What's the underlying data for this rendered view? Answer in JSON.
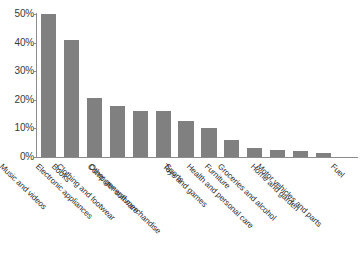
{
  "chart_data": {
    "type": "bar",
    "title": "",
    "subtitle": "",
    "xlabel": "",
    "ylabel": "",
    "ylim": [
      0,
      50
    ],
    "grid": false,
    "legend": null,
    "orientation": "vertical",
    "bar_color": "#808080",
    "axis_color": "#8c8c8c",
    "text_color": "#2e2e2e",
    "categories": [
      "Music and videos",
      "Books",
      "Electronic appliances",
      "Clothing and footwear",
      "Computer software",
      "Other general merchandise",
      "Sports",
      "Toys and games",
      "Furniture",
      "Health and personal care",
      "Groceries and alcohol",
      "Home and garden",
      "Motor vehicles and parts",
      "Fuel"
    ],
    "values": [
      50,
      41,
      20.5,
      18,
      16,
      16,
      12.5,
      10,
      6,
      3,
      2.5,
      2,
      1.5,
      0
    ],
    "value_labels": [
      "50%",
      "41%",
      "20.5%",
      "18%",
      "16%",
      "16%",
      "12.5%",
      "10%",
      "6%",
      "3%",
      "2.5%",
      "2%",
      "1.5%",
      "0%"
    ],
    "yticks": [
      0,
      10,
      20,
      30,
      40,
      50
    ],
    "ytick_labels": [
      "0%",
      "10%",
      "20%",
      "30%",
      "40%",
      "50%"
    ]
  }
}
